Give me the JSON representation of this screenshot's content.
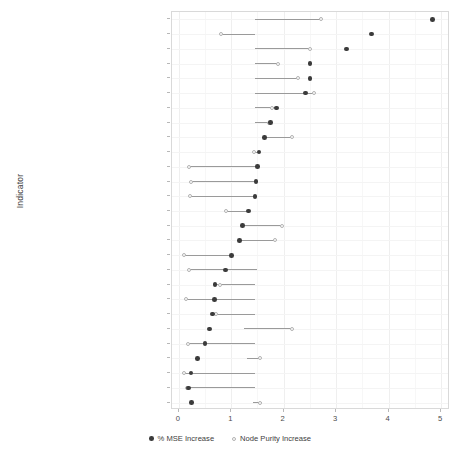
{
  "chart_data": {
    "type": "scatter",
    "title": "",
    "xlabel": "",
    "ylabel": "Indicator",
    "xlim": [
      -0.13,
      5.17
    ],
    "xticks": [
      0,
      1,
      2,
      3,
      4,
      5
    ],
    "xticklabels": [
      "0",
      "1",
      "2",
      "3",
      "4",
      "5"
    ],
    "grid": true,
    "legend_position": "bottom",
    "series": [
      {
        "name": "% MSE Increase",
        "key": "mse",
        "marker": "filled-circle",
        "color": "#3b3b3b"
      },
      {
        "name": "Node Purity Increase",
        "key": "purity",
        "marker": "open-circle",
        "color": "#b2b2b2"
      }
    ],
    "categories": [
      "Element size",
      "Rare OSM tags",
      "Contributor experience",
      "No. of OSM elements in surrounding",
      "Contributor remoteness",
      "Change globalness",
      "Coverage of OSM elements in surrounding",
      "Time since last edit",
      "Contributor diversity",
      "Geometry complexity",
      "North American element",
      "landuse=forest",
      "landuse=grass",
      "No. of linting issues in surrounding",
      "HDI",
      "Population density",
      "landuse=meadow",
      "Imported data",
      "Geometric border alignment",
      "JOSM editor used",
      "Diversity of OSM elements in surrounding",
      "Geometric border segment length",
      "ID editor used",
      "Time since element creation",
      "Local mapping",
      "Negative linter flag",
      "No. of active mappers in surrounding"
    ],
    "points": [
      {
        "category": "Element size",
        "mse": 4.84,
        "purity": 2.72,
        "segment": [
          1.45,
          2.72
        ]
      },
      {
        "category": "Rare OSM tags",
        "mse": 3.67,
        "purity": 0.8,
        "segment": [
          0.8,
          1.45
        ]
      },
      {
        "category": "Contributor experience",
        "mse": 3.2,
        "purity": 2.51,
        "segment": [
          1.45,
          2.51
        ]
      },
      {
        "category": "No. of OSM elements in surrounding",
        "mse": 2.5,
        "purity": 1.9,
        "segment": [
          1.45,
          1.9
        ]
      },
      {
        "category": "Contributor remoteness",
        "mse": 2.5,
        "purity": 2.28,
        "segment": [
          1.45,
          2.28
        ]
      },
      {
        "category": "Change globalness",
        "mse": 2.42,
        "purity": 2.57,
        "segment": [
          1.45,
          2.57
        ]
      },
      {
        "category": "Coverage of OSM elements in surrounding",
        "mse": 1.86,
        "purity": 1.78,
        "segment": [
          1.45,
          1.86
        ]
      },
      {
        "category": "Time since last edit",
        "mse": 1.75,
        "purity": 1.72,
        "segment": [
          1.45,
          1.75
        ]
      },
      {
        "category": "Contributor diversity",
        "mse": 1.63,
        "purity": 2.15,
        "segment": [
          1.63,
          2.15
        ]
      },
      {
        "category": "Geometry complexity",
        "mse": 1.53,
        "purity": 1.43,
        "segment": [
          1.43,
          1.53
        ]
      },
      {
        "category": "North American element",
        "mse": 1.5,
        "purity": 0.2,
        "segment": [
          0.2,
          1.5
        ]
      },
      {
        "category": "landuse=forest",
        "mse": 1.47,
        "purity": 0.23,
        "segment": [
          0.23,
          1.47
        ]
      },
      {
        "category": "landuse=grass",
        "mse": 1.45,
        "purity": 0.21,
        "segment": [
          0.21,
          1.45
        ]
      },
      {
        "category": "No. of linting issues in surrounding",
        "mse": 1.33,
        "purity": 0.9,
        "segment": [
          0.9,
          1.33
        ]
      },
      {
        "category": "HDI",
        "mse": 1.21,
        "purity": 1.96,
        "segment": [
          1.21,
          1.96
        ]
      },
      {
        "category": "Population density",
        "mse": 1.16,
        "purity": 1.83,
        "segment": [
          1.16,
          1.83
        ]
      },
      {
        "category": "landuse=meadow",
        "mse": 1.01,
        "purity": 0.1,
        "segment": [
          0.1,
          1.01
        ]
      },
      {
        "category": "Imported data",
        "mse": 0.89,
        "purity": 0.19,
        "segment": [
          0.19,
          1.5
        ]
      },
      {
        "category": "Geometric border alignment",
        "mse": 0.69,
        "purity": 0.78,
        "segment": [
          0.69,
          1.45
        ]
      },
      {
        "category": "JOSM editor used",
        "mse": 0.68,
        "purity": 0.14,
        "segment": [
          0.14,
          1.45
        ]
      },
      {
        "category": "Diversity of OSM elements in surrounding",
        "mse": 0.64,
        "purity": 0.71,
        "segment": [
          0.64,
          1.45
        ]
      },
      {
        "category": "Geometric border segment length",
        "mse": 0.58,
        "purity": 2.15,
        "segment": [
          1.25,
          2.15
        ]
      },
      {
        "category": "ID editor used",
        "mse": 0.5,
        "purity": 0.17,
        "segment": [
          0.17,
          1.45
        ]
      },
      {
        "category": "Time since element creation",
        "mse": 0.36,
        "purity": 1.55,
        "segment": [
          1.3,
          1.55
        ]
      },
      {
        "category": "Local mapping",
        "mse": 0.23,
        "purity": 0.09,
        "segment": [
          0.09,
          1.45
        ]
      },
      {
        "category": "Negative linter flag",
        "mse": 0.19,
        "purity": 0.16,
        "segment": [
          0.16,
          1.45
        ]
      },
      {
        "category": "No. of active mappers in surrounding",
        "mse": 0.24,
        "purity": 1.55,
        "segment": [
          1.42,
          1.58
        ]
      }
    ]
  },
  "legend": {
    "items": [
      {
        "label": "% MSE Increase",
        "key": "mse"
      },
      {
        "label": "Node Purity Increase",
        "key": "purity"
      }
    ]
  },
  "axis": {
    "y_title": "Indicator"
  }
}
